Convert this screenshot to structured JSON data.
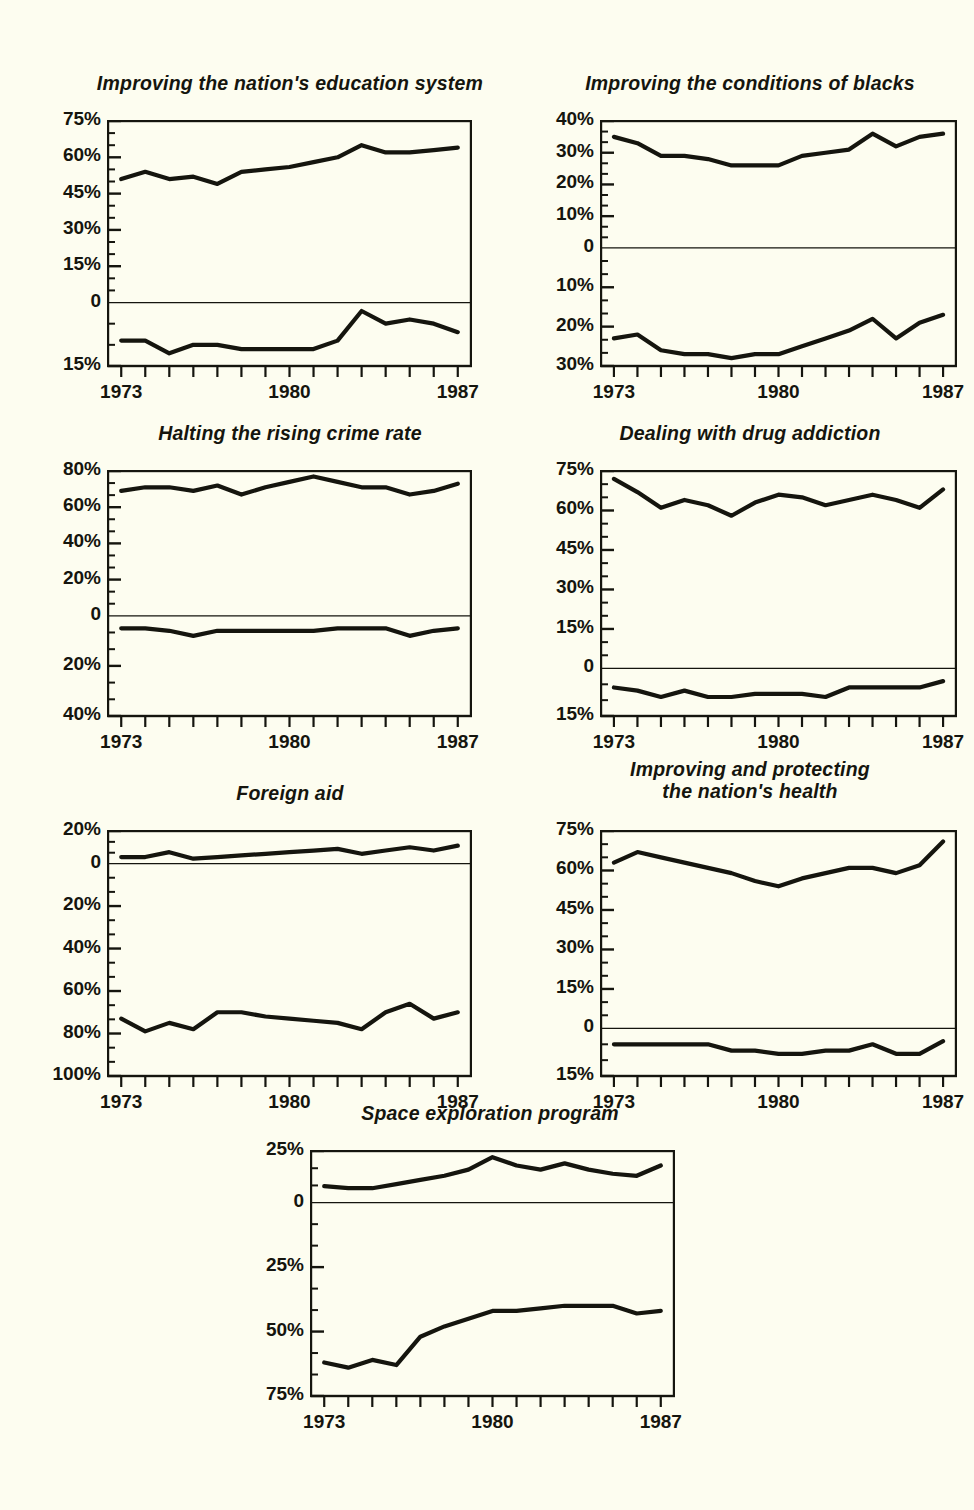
{
  "figure": {
    "background_color": "#FDFDF0",
    "ink_color": "#15150e",
    "x_start_year": 1973,
    "x_end_year": 1987,
    "x_tick_labels": [
      "1973",
      "1980",
      "1987"
    ],
    "series_names": [
      "Too little (spending)",
      "Too much (spending)"
    ],
    "note": "Each panel shows an upper line (percent saying too little) above a zero baseline and a lower line (percent saying too much) plotted downward below zero."
  },
  "chart_data": [
    {
      "type": "line",
      "panel": 1,
      "title": "Improving the nation's education system",
      "xlabel": "",
      "ylabel": "",
      "grid": false,
      "legend": "none",
      "x": [
        1973,
        1974,
        1975,
        1976,
        1977,
        1978,
        1979,
        1980,
        1981,
        1982,
        1983,
        1984,
        1985,
        1986,
        1987
      ],
      "y_upper_ticks": [
        0,
        15,
        30,
        45,
        60,
        75
      ],
      "y_upper_tick_labels": [
        "0",
        "15%",
        "30%",
        "45%",
        "60%",
        "75%"
      ],
      "y_lower_ticks": [
        15
      ],
      "y_lower_tick_labels": [
        "15%"
      ],
      "ylim_upper": [
        0,
        75
      ],
      "ylim_lower": [
        0,
        15
      ],
      "series": [
        {
          "name": "Too little",
          "direction": "up",
          "values": [
            51,
            54,
            51,
            52,
            49,
            54,
            55,
            56,
            58,
            60,
            65,
            62,
            62,
            63,
            64
          ]
        },
        {
          "name": "Too much",
          "direction": "down",
          "values": [
            9,
            9,
            12,
            10,
            10,
            11,
            11,
            11,
            11,
            9,
            2,
            5,
            4,
            5,
            7
          ]
        }
      ]
    },
    {
      "type": "line",
      "panel": 2,
      "title": "Improving the conditions of blacks",
      "xlabel": "",
      "ylabel": "",
      "grid": false,
      "legend": "none",
      "x": [
        1973,
        1974,
        1975,
        1976,
        1977,
        1978,
        1979,
        1980,
        1981,
        1982,
        1983,
        1984,
        1985,
        1986,
        1987
      ],
      "y_upper_ticks": [
        0,
        10,
        20,
        30,
        40
      ],
      "y_upper_tick_labels": [
        "0",
        "10%",
        "20%",
        "30%",
        "40%"
      ],
      "y_lower_ticks": [
        10,
        20,
        30
      ],
      "y_lower_tick_labels": [
        "10%",
        "20%",
        "30%"
      ],
      "ylim_upper": [
        0,
        40
      ],
      "ylim_lower": [
        0,
        30
      ],
      "series": [
        {
          "name": "Too little",
          "direction": "up",
          "values": [
            35,
            33,
            29,
            29,
            28,
            26,
            26,
            26,
            29,
            30,
            31,
            36,
            32,
            35,
            36
          ]
        },
        {
          "name": "Too much",
          "direction": "down",
          "values": [
            23,
            22,
            26,
            27,
            27,
            28,
            27,
            27,
            25,
            23,
            21,
            18,
            23,
            19,
            17
          ]
        }
      ]
    },
    {
      "type": "line",
      "panel": 3,
      "title": "Halting the rising crime rate",
      "xlabel": "",
      "ylabel": "",
      "grid": false,
      "legend": "none",
      "x": [
        1973,
        1974,
        1975,
        1976,
        1977,
        1978,
        1979,
        1980,
        1981,
        1982,
        1983,
        1984,
        1985,
        1986,
        1987
      ],
      "y_upper_ticks": [
        0,
        20,
        40,
        60,
        80
      ],
      "y_upper_tick_labels": [
        "0",
        "20%",
        "40%",
        "60%",
        "80%"
      ],
      "y_lower_ticks": [
        20,
        40
      ],
      "y_lower_tick_labels": [
        "20%",
        "40%"
      ],
      "ylim_upper": [
        0,
        80
      ],
      "ylim_lower": [
        0,
        40
      ],
      "series": [
        {
          "name": "Too little",
          "direction": "up",
          "values": [
            69,
            71,
            71,
            69,
            72,
            67,
            71,
            74,
            77,
            74,
            71,
            71,
            67,
            69,
            73
          ]
        },
        {
          "name": "Too much",
          "direction": "down",
          "values": [
            5,
            5,
            6,
            8,
            6,
            6,
            6,
            6,
            6,
            5,
            5,
            5,
            8,
            6,
            5
          ]
        }
      ]
    },
    {
      "type": "line",
      "panel": 4,
      "title": "Dealing with drug addiction",
      "xlabel": "",
      "ylabel": "",
      "grid": false,
      "legend": "none",
      "x": [
        1973,
        1974,
        1975,
        1976,
        1977,
        1978,
        1979,
        1980,
        1981,
        1982,
        1983,
        1984,
        1985,
        1986,
        1987
      ],
      "y_upper_ticks": [
        0,
        15,
        30,
        45,
        60,
        75
      ],
      "y_upper_tick_labels": [
        "0",
        "15%",
        "30%",
        "45%",
        "60%",
        "75%"
      ],
      "y_lower_ticks": [
        15
      ],
      "y_lower_tick_labels": [
        "15%"
      ],
      "ylim_upper": [
        0,
        75
      ],
      "ylim_lower": [
        0,
        15
      ],
      "series": [
        {
          "name": "Too little",
          "direction": "up",
          "values": [
            72,
            67,
            61,
            64,
            62,
            58,
            63,
            66,
            65,
            62,
            64,
            66,
            64,
            61,
            68
          ]
        },
        {
          "name": "Too much",
          "direction": "down",
          "values": [
            6,
            7,
            9,
            7,
            9,
            9,
            8,
            8,
            8,
            9,
            6,
            6,
            6,
            6,
            4
          ]
        }
      ]
    },
    {
      "type": "line",
      "panel": 5,
      "title": "Foreign aid",
      "xlabel": "",
      "ylabel": "",
      "grid": false,
      "legend": "none",
      "x": [
        1973,
        1974,
        1975,
        1976,
        1977,
        1978,
        1979,
        1980,
        1981,
        1982,
        1983,
        1984,
        1985,
        1986,
        1987
      ],
      "y_upper_ticks": [
        0,
        20
      ],
      "y_upper_tick_labels": [
        "0",
        "20%"
      ],
      "y_lower_ticks": [
        20,
        40,
        60,
        80,
        100
      ],
      "y_lower_tick_labels": [
        "20%",
        "40%",
        "60%",
        "80%",
        "100%"
      ],
      "ylim_upper": [
        0,
        20
      ],
      "ylim_lower": [
        0,
        100
      ],
      "series": [
        {
          "name": "Too little",
          "direction": "up",
          "values": [
            4,
            4,
            7,
            3,
            4,
            5,
            6,
            7,
            8,
            9,
            6,
            8,
            10,
            8,
            11
          ]
        },
        {
          "name": "Too much",
          "direction": "down",
          "values": [
            73,
            79,
            75,
            78,
            70,
            70,
            72,
            73,
            74,
            75,
            78,
            70,
            66,
            73,
            70
          ]
        }
      ]
    },
    {
      "type": "line",
      "panel": 6,
      "title": "Improving and protecting\nthe nation's health",
      "xlabel": "",
      "ylabel": "",
      "grid": false,
      "legend": "none",
      "x": [
        1973,
        1974,
        1975,
        1976,
        1977,
        1978,
        1979,
        1980,
        1981,
        1982,
        1983,
        1984,
        1985,
        1986,
        1987
      ],
      "y_upper_ticks": [
        0,
        15,
        30,
        45,
        60,
        75
      ],
      "y_upper_tick_labels": [
        "0",
        "15%",
        "30%",
        "45%",
        "60%",
        "75%"
      ],
      "y_lower_ticks": [
        15
      ],
      "y_lower_tick_labels": [
        "15%"
      ],
      "ylim_upper": [
        0,
        75
      ],
      "ylim_lower": [
        0,
        15
      ],
      "series": [
        {
          "name": "Too little",
          "direction": "up",
          "values": [
            63,
            67,
            65,
            63,
            61,
            59,
            56,
            54,
            57,
            59,
            61,
            61,
            59,
            62,
            71
          ]
        },
        {
          "name": "Too much",
          "direction": "down",
          "values": [
            5,
            5,
            5,
            5,
            5,
            7,
            7,
            8,
            8,
            7,
            7,
            5,
            8,
            8,
            4
          ]
        }
      ]
    },
    {
      "type": "line",
      "panel": 7,
      "title": "Space exploration program",
      "xlabel": "",
      "ylabel": "",
      "grid": false,
      "legend": "none",
      "x": [
        1973,
        1974,
        1975,
        1976,
        1977,
        1978,
        1979,
        1980,
        1981,
        1982,
        1983,
        1984,
        1985,
        1986,
        1987
      ],
      "y_upper_ticks": [
        0,
        25
      ],
      "y_upper_tick_labels": [
        "0",
        "25%"
      ],
      "y_lower_ticks": [
        25,
        50,
        75
      ],
      "y_lower_tick_labels": [
        "25%",
        "50%",
        "75%"
      ],
      "ylim_upper": [
        0,
        25
      ],
      "ylim_lower": [
        0,
        75
      ],
      "series": [
        {
          "name": "Too little",
          "direction": "up",
          "values": [
            8,
            7,
            7,
            9,
            11,
            13,
            16,
            22,
            18,
            16,
            19,
            16,
            14,
            13,
            18
          ]
        },
        {
          "name": "Too much",
          "direction": "down",
          "values": [
            62,
            64,
            61,
            63,
            52,
            48,
            45,
            42,
            42,
            41,
            40,
            40,
            40,
            43,
            42
          ]
        }
      ]
    }
  ]
}
